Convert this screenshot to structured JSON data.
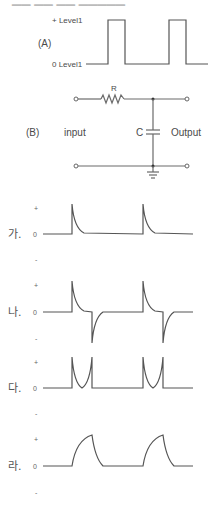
{
  "header": {
    "clipped_text": "▁▁ ▁▁ ▁▁ ▁▁▁▁▁"
  },
  "panel_a": {
    "label": "(A)",
    "level_high": "+ Level1",
    "level_low": "0 Level1"
  },
  "panel_b": {
    "label": "(B)",
    "resistor": "R",
    "capacitor": "C",
    "input_label": "input",
    "output_label": "Output"
  },
  "options": [
    {
      "label": "가.",
      "plus": "+",
      "zero": "0",
      "minus": "-",
      "shape": "positive-decaying-spikes"
    },
    {
      "label": "나.",
      "plus": "+",
      "zero": "0",
      "minus": "-",
      "shape": "alternating-spikes"
    },
    {
      "label": "다.",
      "plus": "+",
      "zero": "0",
      "minus": "-",
      "shape": "u-shaped-pulses"
    },
    {
      "label": "라.",
      "plus": "+",
      "zero": "0",
      "minus": "-",
      "shape": "rc-charge-discharge"
    }
  ],
  "colors": {
    "line": "#555555",
    "text": "#4a4a4a",
    "background": "#ffffff"
  }
}
